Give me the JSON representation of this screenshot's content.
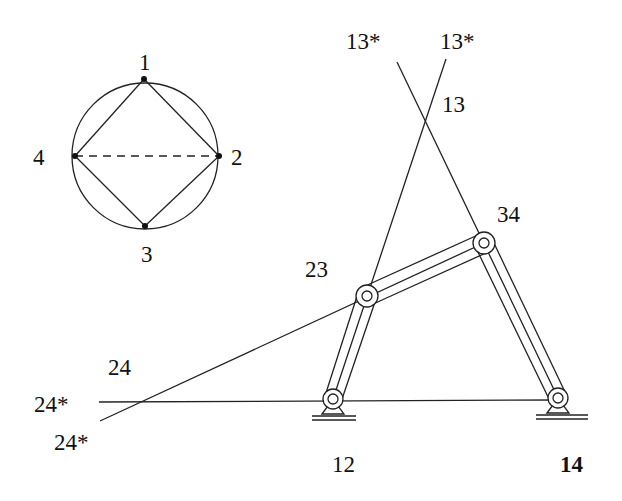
{
  "figure": {
    "circle": {
      "center": [
        145,
        156
      ],
      "radius": 73,
      "points": [
        {
          "label": "1",
          "x": 144,
          "y": 79,
          "label_x": 147,
          "label_y": 70
        },
        {
          "label": "2",
          "x": 219,
          "y": 156,
          "label_x": 237,
          "label_y": 165
        },
        {
          "label": "3",
          "x": 145,
          "y": 226,
          "label_x": 149,
          "label_y": 262
        },
        {
          "label": "4",
          "x": 75,
          "y": 156,
          "label_x": 40,
          "label_y": 165
        }
      ],
      "solid_edges": [
        [
          "1",
          "2"
        ],
        [
          "2",
          "3"
        ],
        [
          "3",
          "4"
        ],
        [
          "4",
          "1"
        ]
      ],
      "dashed_edges": [
        [
          "4",
          "2"
        ]
      ]
    },
    "joints": [
      {
        "label": "12",
        "x": 333,
        "y": 399,
        "ground": true,
        "label_x": 332,
        "label_y": 472,
        "bold": false
      },
      {
        "label": "23",
        "x": 367,
        "y": 296,
        "ground": false,
        "label_x": 305,
        "label_y": 277,
        "bold": false
      },
      {
        "label": "34",
        "x": 484,
        "y": 243,
        "ground": false,
        "label_x": 497,
        "label_y": 222,
        "bold": false
      },
      {
        "label": "14",
        "x": 558,
        "y": 398,
        "ground": true,
        "label_x": 560,
        "label_y": 472,
        "bold": true
      }
    ],
    "construction_labels": [
      {
        "label": "13*",
        "x": 346,
        "y": 49
      },
      {
        "label": "13*",
        "x": 440,
        "y": 49
      },
      {
        "label": "13",
        "x": 442,
        "y": 112
      },
      {
        "label": "24",
        "x": 108,
        "y": 375
      },
      {
        "label": "24*",
        "x": 34,
        "y": 412
      },
      {
        "label": "24*",
        "x": 54,
        "y": 450
      }
    ]
  }
}
